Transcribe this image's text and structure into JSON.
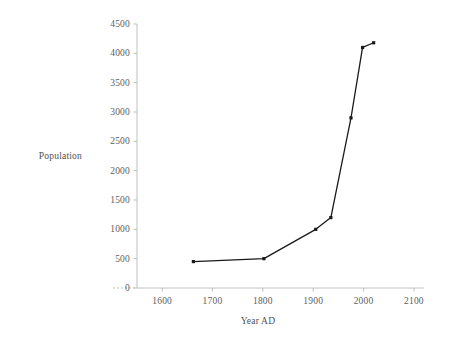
{
  "chart_data": {
    "type": "line",
    "title": "",
    "xlabel": "Year AD",
    "ylabel": "Population",
    "xlim": [
      1550,
      2120
    ],
    "ylim": [
      0,
      4500
    ],
    "grid": false,
    "legend": null,
    "x": [
      1662,
      1802,
      1905,
      1935,
      1975,
      1998,
      2020
    ],
    "values": [
      450,
      500,
      1000,
      1200,
      2900,
      4100,
      4180
    ],
    "series": [
      {
        "name": "Population",
        "x": [
          1662,
          1802,
          1905,
          1935,
          1975,
          1998,
          2020
        ],
        "values": [
          450,
          500,
          1000,
          1200,
          2900,
          4100,
          4180
        ]
      }
    ],
    "x_ticks": [
      1600,
      1700,
      1800,
      1900,
      2000,
      2100
    ],
    "x_tick_labels": [
      "1600",
      "1700",
      "1800",
      "1900",
      "2000",
      "2100"
    ],
    "y_ticks": [
      0,
      500,
      1000,
      1500,
      2000,
      2500,
      3000,
      3500,
      4000,
      4500
    ],
    "y_tick_labels": [
      "0",
      "500",
      "1000",
      "1500",
      "2000",
      "2500",
      "3000",
      "3500",
      "4000",
      "4500"
    ],
    "line_color": "#1a1a1a",
    "marker_color": "#1a1a1a",
    "axis_color": "#bfbfbf",
    "tick_text_color": "#606060",
    "background_color": "#ffffff",
    "marker": "square",
    "baseline_dash": true
  }
}
